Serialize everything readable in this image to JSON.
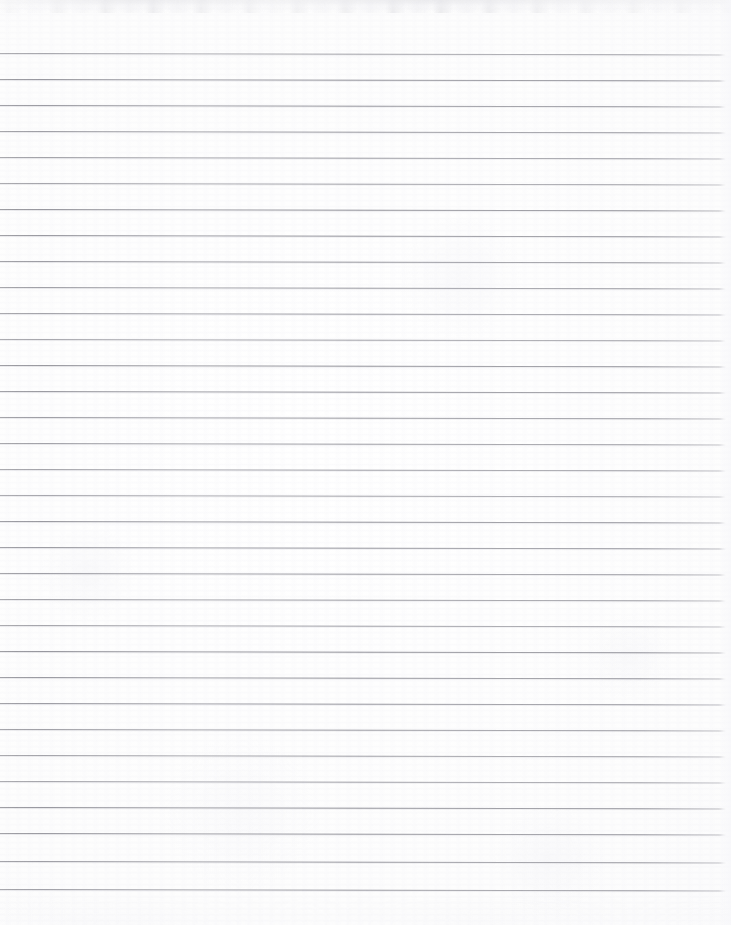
{
  "document": {
    "kind": "scanned-lined-paper",
    "title": "Blank ruled notebook page",
    "content_text": "",
    "handwriting_present": "false",
    "printed_text_present": "false"
  },
  "page": {
    "width": 731,
    "height": 925,
    "background_color": "#fdfdfd",
    "paper_tone": "#ffffff",
    "orientation": "portrait"
  },
  "ruling": {
    "line_color": "#8b8b93",
    "line_halo_color": "#cdcdd4",
    "line_thickness": 1,
    "line_count": 33,
    "spacing": 26,
    "first_line_y": 53,
    "last_line_y": 889,
    "line_start_x": 0,
    "line_end_x": 726,
    "skew_degrees": 0.12,
    "margin_rule_present": "false",
    "top_margin_blank": 53,
    "bottom_margin_blank": 36,
    "line_y_positions": [
      53,
      79,
      105,
      131,
      157,
      183,
      209,
      235,
      261,
      287,
      313,
      339,
      365,
      391,
      417,
      443,
      469,
      495,
      521,
      547,
      573,
      599,
      625,
      651,
      677,
      703,
      729,
      755,
      781,
      807,
      833,
      861,
      889
    ]
  },
  "scan_artifacts": {
    "top_smudge_color": "#e2e2e6",
    "top_smudge_height": 13,
    "bottom_smudge_color": "#f0f0f4",
    "bottom_smudge_height": 30,
    "grain_present": "true",
    "vignette_present": "true"
  }
}
